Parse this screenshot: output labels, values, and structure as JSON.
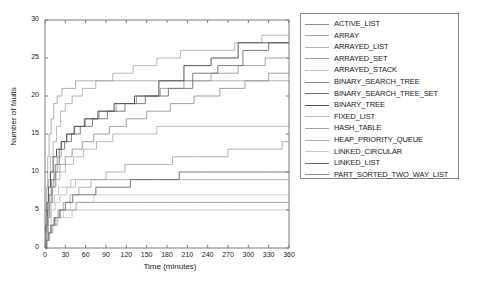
{
  "chart_data": {
    "type": "line",
    "title": "",
    "xlabel": "Time (minutes)",
    "ylabel": "Number of faults",
    "xlim": [
      0,
      360
    ],
    "ylim": [
      0,
      30
    ],
    "xticks": [
      0,
      30,
      60,
      90,
      120,
      150,
      180,
      210,
      240,
      270,
      300,
      330,
      360
    ],
    "yticks": [
      0,
      5,
      10,
      15,
      20,
      25,
      30
    ],
    "grid": false,
    "legend_position": "right-outside",
    "step_style": "post",
    "series": [
      {
        "name": "ACTIVE_LIST",
        "color": "#8e8e8e",
        "width": 0.8,
        "x": [
          0,
          2,
          4,
          6,
          9,
          13,
          18,
          24,
          32,
          44,
          60,
          80,
          105,
          135,
          170,
          205,
          245,
          285,
          325,
          360
        ],
        "y": [
          0,
          2,
          4,
          6,
          8,
          10,
          12,
          14,
          15,
          16,
          17,
          18,
          19,
          20,
          21,
          22,
          23,
          24,
          25,
          25
        ]
      },
      {
        "name": "ARRAY",
        "color": "#a6a6a6",
        "width": 0.8,
        "x": [
          0,
          1,
          3,
          5,
          8,
          12,
          17,
          23,
          30,
          40,
          55,
          75,
          100,
          130,
          165,
          200,
          240,
          280,
          320,
          360
        ],
        "y": [
          0,
          3,
          6,
          9,
          12,
          14,
          16,
          18,
          19,
          20,
          21,
          22,
          23,
          24,
          25,
          26,
          26,
          27,
          28,
          28
        ]
      },
      {
        "name": "ARRAYED_LIST",
        "color": "#b5b5b5",
        "width": 0.8,
        "x": [
          0,
          2,
          5,
          9,
          14,
          20,
          28,
          38,
          52,
          70,
          95,
          125,
          160,
          200,
          245,
          290,
          330,
          360
        ],
        "y": [
          0,
          2,
          4,
          6,
          7,
          8,
          8,
          9,
          9,
          9,
          9,
          9,
          9,
          9,
          9,
          9,
          9,
          9
        ]
      },
      {
        "name": "ARRAYED_SET",
        "color": "#9a9a9a",
        "width": 0.8,
        "x": [
          0,
          1,
          2,
          4,
          6,
          9,
          13,
          18,
          25,
          33,
          45,
          60,
          80,
          105,
          135,
          170,
          210,
          255,
          300,
          345,
          360
        ],
        "y": [
          0,
          4,
          8,
          12,
          15,
          17,
          19,
          20,
          21,
          21,
          22,
          22,
          22,
          22,
          22,
          22,
          22,
          22,
          22,
          22,
          22
        ]
      },
      {
        "name": "ARRAYED_STACK",
        "color": "#c2c2c2",
        "width": 0.8,
        "x": [
          0,
          3,
          7,
          12,
          19,
          28,
          40,
          56,
          76,
          100,
          130,
          165,
          205,
          250,
          295,
          340,
          360
        ],
        "y": [
          0,
          1,
          2,
          3,
          4,
          4,
          5,
          5,
          5,
          5,
          5,
          5,
          5,
          5,
          5,
          5,
          5
        ]
      },
      {
        "name": "BINARY_SEARCH_TREE",
        "color": "#8a8a8a",
        "width": 0.8,
        "x": [
          0,
          2,
          4,
          7,
          11,
          16,
          22,
          30,
          40,
          55,
          72,
          95,
          120,
          150,
          185,
          220,
          258,
          295,
          330,
          360
        ],
        "y": [
          0,
          2,
          4,
          6,
          8,
          10,
          11,
          12,
          13,
          14,
          15,
          16,
          17,
          18,
          19,
          20,
          21,
          22,
          23,
          23
        ]
      },
      {
        "name": "BINARY_SEARCH_TREE_SET",
        "color": "#707070",
        "width": 0.9,
        "x": [
          0,
          2,
          4,
          6,
          10,
          15,
          21,
          29,
          39,
          52,
          70,
          92,
          118,
          148,
          182,
          218,
          255,
          292,
          330,
          360
        ],
        "y": [
          0,
          3,
          5,
          7,
          9,
          11,
          13,
          14,
          15,
          16,
          17,
          18,
          19,
          20,
          21,
          23,
          24,
          26,
          27,
          27
        ]
      },
      {
        "name": "BINARY_TREE",
        "color": "#555555",
        "width": 1.0,
        "x": [
          0,
          1,
          3,
          5,
          8,
          12,
          17,
          24,
          32,
          43,
          58,
          78,
          102,
          132,
          168,
          205,
          245,
          285,
          325,
          360
        ],
        "y": [
          0,
          3,
          6,
          8,
          10,
          12,
          13,
          14,
          15,
          16,
          17,
          18,
          19,
          20,
          22,
          24,
          25,
          27,
          27,
          27
        ]
      },
      {
        "name": "FIXED_LIST",
        "color": "#bdbdbd",
        "width": 0.8,
        "x": [
          0,
          2,
          5,
          9,
          15,
          22,
          32,
          45,
          62,
          85,
          112,
          145,
          185,
          228,
          272,
          318,
          360
        ],
        "y": [
          0,
          2,
          3,
          5,
          6,
          7,
          8,
          9,
          9,
          9,
          9,
          9,
          9,
          9,
          9,
          9,
          9
        ]
      },
      {
        "name": "HASH_TABLE",
        "color": "#9e9e9e",
        "width": 0.8,
        "x": [
          0,
          2,
          4,
          8,
          13,
          19,
          27,
          37,
          50,
          68,
          90,
          118,
          150,
          188,
          228,
          270,
          312,
          350,
          360
        ],
        "y": [
          0,
          1,
          2,
          3,
          4,
          5,
          6,
          7,
          8,
          9,
          10,
          11,
          11,
          12,
          12,
          13,
          13,
          14,
          14
        ]
      },
      {
        "name": "HEAP_PRIORITY_QUEUE",
        "color": "#acacac",
        "width": 0.8,
        "x": [
          0,
          1,
          3,
          6,
          10,
          15,
          22,
          30,
          42,
          57,
          76,
          100,
          130,
          165,
          205,
          248,
          292,
          336,
          360
        ],
        "y": [
          0,
          2,
          4,
          6,
          8,
          9,
          10,
          11,
          12,
          13,
          14,
          15,
          15,
          16,
          16,
          16,
          16,
          16,
          16
        ]
      },
      {
        "name": "LINKED_CIRCULAR",
        "color": "#c8c8c8",
        "width": 0.8,
        "x": [
          0,
          2,
          6,
          11,
          18,
          27,
          38,
          53,
          72,
          96,
          125,
          160,
          200,
          245,
          292,
          340,
          360
        ],
        "y": [
          0,
          1,
          2,
          3,
          4,
          5,
          6,
          6,
          7,
          7,
          7,
          7,
          7,
          7,
          7,
          7,
          7
        ]
      },
      {
        "name": "LINKED_LIST",
        "color": "#6b6b6b",
        "width": 0.9,
        "x": [
          0,
          2,
          5,
          9,
          14,
          21,
          30,
          41,
          56,
          75,
          98,
          126,
          160,
          198,
          240,
          285,
          330,
          360
        ],
        "y": [
          0,
          1,
          2,
          3,
          4,
          5,
          6,
          7,
          7,
          8,
          8,
          9,
          9,
          10,
          10,
          10,
          10,
          10
        ]
      },
      {
        "name": "PART_SORTED_TWO_WAY_LIST",
        "color": "#8f8f8f",
        "width": 0.8,
        "x": [
          0,
          3,
          6,
          10,
          16,
          23,
          33,
          46,
          63,
          85,
          112,
          145,
          182,
          222,
          265,
          310,
          352,
          360
        ],
        "y": [
          0,
          1,
          2,
          3,
          4,
          5,
          5,
          6,
          6,
          6,
          6,
          6,
          6,
          6,
          6,
          6,
          6,
          6
        ]
      }
    ]
  },
  "axis": {
    "color": "#7a7a7a",
    "text_color": "#1a1a1a"
  }
}
